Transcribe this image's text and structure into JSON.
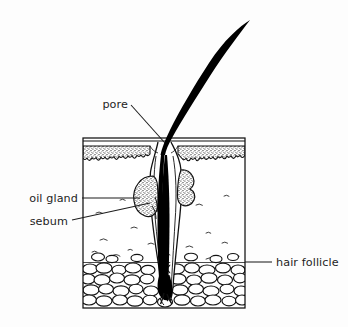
{
  "figure": {
    "background_color": "#fdfdfd",
    "ink_color": "#111111",
    "label_color": "#1d1d1d"
  },
  "labels": {
    "pore": "pore",
    "oil_gland": "oil gland",
    "sebum": "sebum",
    "hair_follicle": "hair follicle"
  },
  "structures": {
    "hair_shaft": "hair-shaft",
    "epidermis": "epidermis",
    "dermis": "dermis",
    "subcutaneous_fat": "subcutaneous-fat",
    "sebaceous_gland_left": "sebaceous-gland-left",
    "sebaceous_gland_right": "sebaceous-gland-right",
    "hair_bulb": "hair-bulb",
    "follicle_canal": "follicle-canal"
  }
}
